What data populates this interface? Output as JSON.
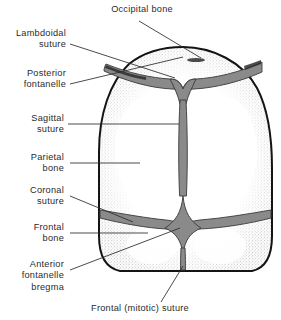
{
  "figure": {
    "title_text": "Fetal skull viewed from above showing sutures and fontanelles",
    "colors": {
      "outline": "#141414",
      "suture_fill": "#8a8a8a",
      "suture_stroke": "#3a3a3a",
      "bone_fill": "#ffffff",
      "stipple": "#6d6d6d",
      "leader": "#2a2a2a",
      "text": "#2b2b2b",
      "background": "#ffffff"
    }
  },
  "labels": {
    "occipital_bone": "Occipital bone",
    "lambdoidal_suture": "Lambdoidal\nsuture",
    "posterior_fontanelle": "Posterior\nfontanelle",
    "sagittal_suture": "Sagittal\nsuture",
    "parietal_bone": "Parietal\nbone",
    "coronal_suture": "Coronal\nsuture",
    "frontal_bone": "Frontal\nbone",
    "anterior_fontanelle_bregma": "Anterior\nfontanelle\nbregma",
    "frontal_mitotic_suture": "Frontal (mitotic) suture"
  },
  "anatomy_parts": [
    {
      "name": "occipital-bone",
      "kind": "bone",
      "label": "Occipital bone"
    },
    {
      "name": "lambdoidal-suture",
      "kind": "suture",
      "label": "Lambdoidal suture"
    },
    {
      "name": "posterior-fontanelle",
      "kind": "fontanelle",
      "label": "Posterior fontanelle"
    },
    {
      "name": "sagittal-suture",
      "kind": "suture",
      "label": "Sagittal suture"
    },
    {
      "name": "parietal-bone",
      "kind": "bone",
      "label": "Parietal bone"
    },
    {
      "name": "coronal-suture",
      "kind": "suture",
      "label": "Coronal suture"
    },
    {
      "name": "frontal-bone",
      "kind": "bone",
      "label": "Frontal bone"
    },
    {
      "name": "anterior-fontanelle-bregma",
      "kind": "fontanelle",
      "label": "Anterior fontanelle bregma"
    },
    {
      "name": "frontal-mitotic-suture",
      "kind": "suture",
      "label": "Frontal (mitotic) suture"
    }
  ]
}
